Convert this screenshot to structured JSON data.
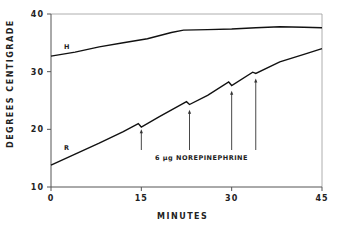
{
  "chart_data": {
    "type": "line",
    "title": "",
    "xlabel": "MINUTES",
    "ylabel": "DEGREES CENTIGRADE",
    "xlim": [
      0,
      45
    ],
    "ylim": [
      10,
      40
    ],
    "x_ticks": [
      "0",
      "15",
      "30",
      "45"
    ],
    "y_ticks": [
      "10",
      "20",
      "30",
      "40"
    ],
    "grid": false,
    "legend": null,
    "series": [
      {
        "name": "H",
        "x": [
          0,
          4,
          8,
          12,
          16,
          20,
          22,
          26,
          30,
          34,
          38,
          42,
          45
        ],
        "y": [
          32.7,
          33.4,
          34.3,
          35.0,
          35.7,
          36.8,
          37.2,
          37.3,
          37.4,
          37.6,
          37.8,
          37.7,
          37.6
        ]
      },
      {
        "name": "R",
        "x": [
          0,
          4,
          8,
          12,
          14.5,
          15,
          18,
          22.5,
          23,
          26,
          29.5,
          30,
          33.5,
          34,
          38,
          42,
          45
        ],
        "y": [
          13.8,
          15.7,
          17.6,
          19.6,
          21.0,
          20.4,
          22.2,
          24.8,
          24.3,
          25.9,
          28.2,
          27.6,
          29.9,
          29.7,
          31.7,
          33.0,
          34.0
        ]
      }
    ],
    "annotations": [
      {
        "text": "6 µg NOREPINEPHRINE",
        "arrows_at_minutes": [
          15,
          23,
          30,
          34
        ]
      },
      {
        "text": "H",
        "x": 3,
        "y": 34.3
      },
      {
        "text": "R",
        "x": 3,
        "y": 17.2
      }
    ]
  },
  "axes": {
    "xlabel": "MINUTES",
    "ylabel": "DEGREES CENTIGRADE",
    "x_tick_labels": [
      "0",
      "15",
      "30",
      "45"
    ],
    "y_tick_labels": [
      "10",
      "20",
      "30",
      "40"
    ]
  },
  "labels": {
    "curve_h": "H",
    "curve_r": "R",
    "annotation": "6 µg NOREPINEPHRINE"
  }
}
